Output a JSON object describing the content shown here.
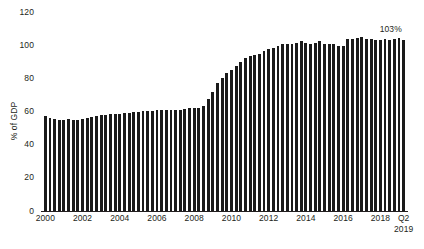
{
  "chart_data": {
    "type": "bar",
    "title": "",
    "subtitle": "",
    "xlabel": "",
    "ylabel": "% of GDP",
    "ylim": [
      0,
      120
    ],
    "yticks": [
      0,
      20,
      40,
      60,
      80,
      100,
      120
    ],
    "ytick_labels": [
      "0",
      "20",
      "40",
      "60",
      "80",
      "100",
      "120"
    ],
    "grid": false,
    "legend": null,
    "x_tick_labels": [
      "2000",
      "2002",
      "2004",
      "2006",
      "2008",
      "2010",
      "2012",
      "2014",
      "2016",
      "2018",
      "Q2"
    ],
    "x_tick_sublabel": "2019",
    "x_tick_quarters": [
      0,
      8,
      16,
      24,
      32,
      40,
      48,
      56,
      64,
      72,
      77
    ],
    "bar_color": "#1a1a1a",
    "annotations": [
      {
        "text": "103%",
        "x_quarter": 77,
        "value": 103
      }
    ],
    "categories": [
      "2000 Q1",
      "2000 Q2",
      "2000 Q3",
      "2000 Q4",
      "2001 Q1",
      "2001 Q2",
      "2001 Q3",
      "2001 Q4",
      "2002 Q1",
      "2002 Q2",
      "2002 Q3",
      "2002 Q4",
      "2003 Q1",
      "2003 Q2",
      "2003 Q3",
      "2003 Q4",
      "2004 Q1",
      "2004 Q2",
      "2004 Q3",
      "2004 Q4",
      "2005 Q1",
      "2005 Q2",
      "2005 Q3",
      "2005 Q4",
      "2006 Q1",
      "2006 Q2",
      "2006 Q3",
      "2006 Q4",
      "2007 Q1",
      "2007 Q2",
      "2007 Q3",
      "2007 Q4",
      "2008 Q1",
      "2008 Q2",
      "2008 Q3",
      "2008 Q4",
      "2009 Q1",
      "2009 Q2",
      "2009 Q3",
      "2009 Q4",
      "2010 Q1",
      "2010 Q2",
      "2010 Q3",
      "2010 Q4",
      "2011 Q1",
      "2011 Q2",
      "2011 Q3",
      "2011 Q4",
      "2012 Q1",
      "2012 Q2",
      "2012 Q3",
      "2012 Q4",
      "2013 Q1",
      "2013 Q2",
      "2013 Q3",
      "2013 Q4",
      "2014 Q1",
      "2014 Q2",
      "2014 Q3",
      "2014 Q4",
      "2015 Q1",
      "2015 Q2",
      "2015 Q3",
      "2015 Q4",
      "2016 Q1",
      "2016 Q2",
      "2016 Q3",
      "2016 Q4",
      "2017 Q1",
      "2017 Q2",
      "2017 Q3",
      "2017 Q4",
      "2018 Q1",
      "2018 Q2",
      "2018 Q3",
      "2018 Q4",
      "2019 Q1",
      "2019 Q2"
    ],
    "values": [
      57.5,
      56.0,
      55.3,
      55.0,
      54.8,
      55.3,
      54.9,
      55.1,
      55.6,
      56.2,
      56.9,
      57.3,
      57.6,
      58.0,
      58.3,
      58.5,
      58.8,
      59.2,
      59.4,
      59.6,
      59.8,
      60.2,
      60.5,
      60.6,
      60.7,
      60.8,
      61.0,
      61.0,
      61.1,
      61.2,
      61.5,
      62.0,
      62.3,
      62.0,
      63.2,
      67.3,
      72.0,
      77.0,
      80.5,
      83.0,
      85.0,
      87.5,
      90.0,
      92.5,
      93.5,
      93.8,
      94.5,
      96.5,
      97.5,
      98.5,
      99.5,
      101.0,
      101.0,
      100.5,
      101.5,
      102.5,
      101.5,
      101.0,
      101.5,
      102.5,
      101.0,
      100.5,
      100.8,
      99.5,
      99.8,
      103.5,
      104.0,
      104.5,
      104.8,
      103.5,
      103.5,
      103.0,
      103.0,
      103.5,
      103.0,
      103.5,
      104.5,
      103.0
    ]
  }
}
